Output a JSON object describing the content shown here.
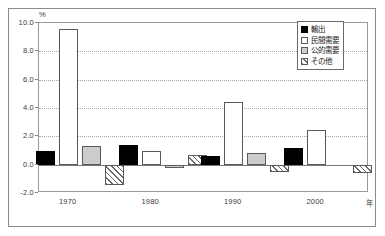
{
  "chart_data": {
    "type": "bar",
    "title": "",
    "subtitle": "",
    "xlabel": "年",
    "ylabel": "%",
    "unit": "%",
    "categories": [
      "1970",
      "1980",
      "1990",
      "2000"
    ],
    "ylim": [
      -2.0,
      10.0
    ],
    "yticks": [
      "10.0",
      "8.0",
      "6.0",
      "4.0",
      "2.0",
      "0.0",
      "-2.0"
    ],
    "ytick_values": [
      10.0,
      8.0,
      6.0,
      4.0,
      2.0,
      0.0,
      -2.0
    ],
    "grid": true,
    "grid_axis": "y",
    "legend_position": "top-right",
    "series": [
      {
        "name": "輸出",
        "key": "exports",
        "values": [
          1.0,
          1.4,
          0.6,
          1.2
        ]
      },
      {
        "name": "民間需要",
        "key": "private",
        "values": [
          9.55,
          1.0,
          4.45,
          2.45
        ]
      },
      {
        "name": "公的需要",
        "key": "public",
        "values": [
          1.3,
          -0.25,
          0.8,
          0.0
        ]
      },
      {
        "name": "その他",
        "key": "other",
        "values": [
          -1.45,
          0.7,
          -0.55,
          -0.6
        ]
      }
    ]
  },
  "legend": {
    "items": [
      {
        "label": "輸出",
        "swatch": "solid-black-square"
      },
      {
        "label": "民間需要",
        "swatch": "white-square"
      },
      {
        "label": "公的需要",
        "swatch": "gray-square"
      },
      {
        "label": "その他",
        "swatch": "hatched-square"
      }
    ]
  },
  "axes": {
    "y_unit_label": "%",
    "x_axis_title": "年",
    "y_tick_labels": [
      "10.0",
      "8.0",
      "6.0",
      "4.0",
      "2.0",
      "0.0",
      "-2.0"
    ],
    "x_tick_labels": [
      "1970",
      "1980",
      "1990",
      "2000"
    ]
  },
  "colors": {
    "exports": "#000000",
    "private": "#ffffff",
    "public": "#cccccc",
    "other_hatch": "#6a6a6a",
    "axis": "#8a8a8a",
    "grid": "#a8a8a8",
    "text": "#1a1a1a",
    "background": "#ffffff"
  }
}
